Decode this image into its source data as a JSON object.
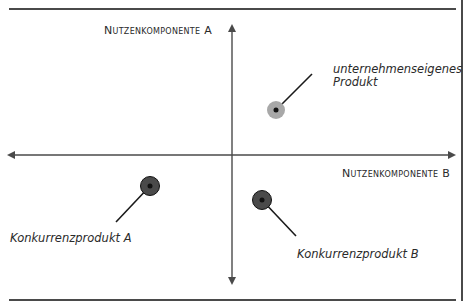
{
  "header": {
    "cropped_caption": "…g … … … …g … … …g … …"
  },
  "axes": {
    "vertical_label": "Nutzenkomponente A",
    "horizontal_label": "Nutzenkomponente B"
  },
  "products": [
    {
      "id": "own",
      "label_line1": "unternehmenseigenes",
      "label_line2": "Produkt",
      "color": "#a8a8a8",
      "center_color": "#111111"
    },
    {
      "id": "competitor-a",
      "label_line1": "Konkurrenzprodukt A",
      "color": "#4a4a4a",
      "center_color": "#111111"
    },
    {
      "id": "competitor-b",
      "label_line1": "Konkurrenzprodukt B",
      "color": "#4a4a4a",
      "center_color": "#111111"
    }
  ],
  "colors": {
    "axis": "#4a4a4a",
    "frame": "#4a4a4a",
    "own_product": "#a8a8a8",
    "competitor": "#4a4a4a"
  }
}
